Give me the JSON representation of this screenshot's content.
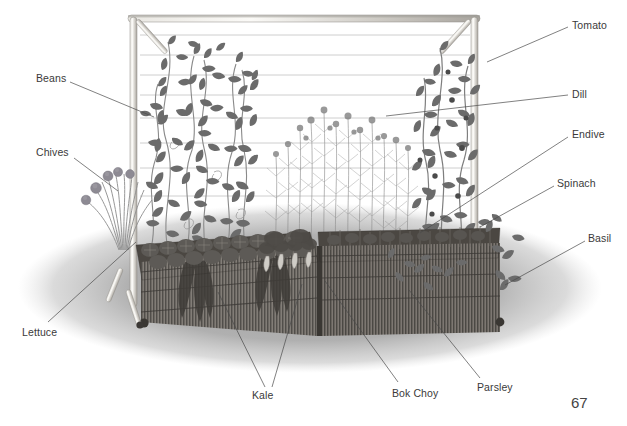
{
  "page": {
    "page_number": "67",
    "background_color": "#ffffff",
    "label_color": "#3a3a3a"
  },
  "illustration": {
    "title": "Raised bed vegetable garden with trellis",
    "description": "Pencil-style illustration of a two-section woven wattle raised garden bed with a bamboo trellis frame strung with horizontal wires, planted with climbing beans, tomatoes, dill, and leafy vegetables, casting an elliptical shadow on the ground.",
    "elements": {
      "trellis_frame_color": "#bfbfbf",
      "bed_wattle_color": "#6a6a6a",
      "foliage_color": "#7d7d7d",
      "shadow_color": "#a9a9a9"
    }
  },
  "labels": [
    {
      "id": "beans",
      "text": "Beans",
      "x": 36,
      "y": 73,
      "anchor": "left",
      "line": [
        [
          70,
          82
        ],
        [
          154,
          117
        ]
      ]
    },
    {
      "id": "chives",
      "text": "Chives",
      "x": 36,
      "y": 147,
      "anchor": "left",
      "line": [
        [
          74,
          158
        ],
        [
          118,
          191
        ]
      ]
    },
    {
      "id": "lettuce",
      "text": "Lettuce",
      "x": 22,
      "y": 327,
      "anchor": "left",
      "line": [
        [
          48,
          322
        ],
        [
          136,
          242
        ]
      ]
    },
    {
      "id": "kale",
      "text": "Kale",
      "x": 252,
      "y": 390,
      "anchor": "left",
      "line": [
        [
          265,
          387
        ],
        [
          218,
          292
        ]
      ],
      "line2": [
        [
          272,
          387
        ],
        [
          302,
          284
        ]
      ]
    },
    {
      "id": "bokchoy",
      "text": "Bok Choy",
      "x": 392,
      "y": 388,
      "anchor": "left",
      "line": [
        [
          398,
          382
        ],
        [
          325,
          281
        ]
      ]
    },
    {
      "id": "parsley",
      "text": "Parsley",
      "x": 477,
      "y": 382,
      "anchor": "left",
      "line": [
        [
          480,
          378
        ],
        [
          409,
          290
        ]
      ]
    },
    {
      "id": "tomato",
      "text": "Tomato",
      "x": 572,
      "y": 20,
      "anchor": "left",
      "line": [
        [
          568,
          27
        ],
        [
          487,
          62
        ]
      ]
    },
    {
      "id": "dill",
      "text": "Dill",
      "x": 572,
      "y": 89,
      "anchor": "left",
      "line": [
        [
          568,
          95
        ],
        [
          386,
          116
        ]
      ]
    },
    {
      "id": "endive",
      "text": "Endive",
      "x": 572,
      "y": 129,
      "anchor": "left",
      "line": [
        [
          568,
          137
        ],
        [
          420,
          233
        ]
      ]
    },
    {
      "id": "spinach",
      "text": "Spinach",
      "x": 557,
      "y": 178,
      "anchor": "left",
      "line": [
        [
          554,
          186
        ],
        [
          480,
          227
        ]
      ]
    },
    {
      "id": "basil",
      "text": "Basil",
      "x": 588,
      "y": 233,
      "anchor": "left",
      "line": [
        [
          585,
          241
        ],
        [
          505,
          285
        ]
      ]
    }
  ],
  "plants": [
    "Beans",
    "Chives",
    "Lettuce",
    "Kale",
    "Bok Choy",
    "Parsley",
    "Tomato",
    "Dill",
    "Endive",
    "Spinach",
    "Basil"
  ]
}
